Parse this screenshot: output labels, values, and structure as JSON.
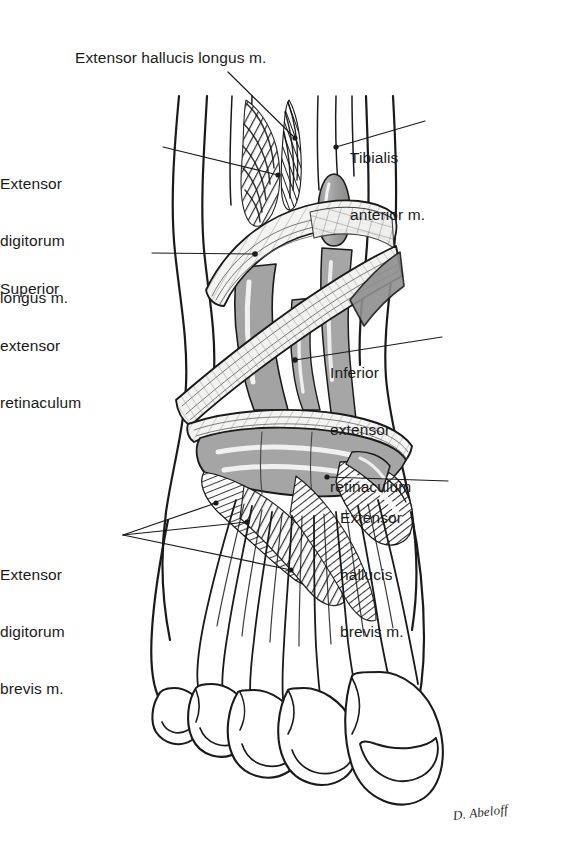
{
  "figure": {
    "background_color": "#ffffff",
    "ink_color": "#1a1a1a",
    "tendon_fill": "#a8a8a8",
    "retinaculum_fill": "#f2f2f0",
    "muscle_hatch_color": "#2b2b2b",
    "signature": "D. Abeloff"
  },
  "labels": [
    {
      "id": "extensor-hallucis-longus",
      "lines": [
        "Extensor hallucis longus m."
      ],
      "align": "left",
      "x": 75,
      "y": 48,
      "leader": "from label baseline down-right to the hallucis longus muscle belly"
    },
    {
      "id": "extensor-digitorum-longus",
      "lines": [
        "Extensor",
        "digitorum",
        "longus m."
      ],
      "align": "right",
      "x": 62,
      "y": 136,
      "leader": "horizontal-ish line right to digitorum longus muscle fibers"
    },
    {
      "id": "superior-extensor-retinaculum",
      "lines": [
        "Superior",
        "extensor",
        "retinaculum"
      ],
      "align": "right",
      "x": 54,
      "y": 241,
      "leader": "horizontal line right to the upper retinaculum band"
    },
    {
      "id": "tibialis-anterior",
      "lines": [
        "Tibialis",
        "anterior m."
      ],
      "align": "left",
      "x": 428,
      "y": 110,
      "leader": "line down-left to tibialis anterior tendon"
    },
    {
      "id": "inferior-extensor-retinaculum",
      "lines": [
        "Inferior",
        "extensor",
        "retinaculum"
      ],
      "align": "left",
      "x": 447,
      "y": 325,
      "leader": "line left to the Y-shaped inferior retinaculum"
    },
    {
      "id": "extensor-hallucis-brevis",
      "lines": [
        "Extensor",
        "hallucis",
        "brevis m."
      ],
      "align": "left",
      "x": 452,
      "y": 470,
      "leader": "line left to hallucis brevis muscle"
    },
    {
      "id": "extensor-digitorum-brevis",
      "lines": [
        "Extensor",
        "digitorum",
        "brevis m."
      ],
      "align": "right",
      "x": 18,
      "y": 527,
      "leader": "three fanned lines right to digitorum brevis muscle bellies"
    }
  ],
  "anatomy_parts": [
    {
      "name": "leg-shaft",
      "kind": "outline"
    },
    {
      "name": "extensor-hallucis-longus-muscle",
      "kind": "muscle-hatching"
    },
    {
      "name": "extensor-digitorum-longus-muscle",
      "kind": "muscle-hatching"
    },
    {
      "name": "tibialis-anterior-tendon",
      "kind": "tendon"
    },
    {
      "name": "superior-extensor-retinaculum-band",
      "kind": "retinaculum"
    },
    {
      "name": "inferior-extensor-retinaculum-band",
      "kind": "retinaculum"
    },
    {
      "name": "extensor-digitorum-brevis-muscle",
      "kind": "muscle-hatching"
    },
    {
      "name": "extensor-hallucis-brevis-muscle",
      "kind": "muscle-hatching"
    },
    {
      "name": "dorsal-tendons",
      "kind": "tendon"
    },
    {
      "name": "toe-1-hallux",
      "kind": "toe"
    },
    {
      "name": "toe-2",
      "kind": "toe"
    },
    {
      "name": "toe-3",
      "kind": "toe"
    },
    {
      "name": "toe-4",
      "kind": "toe"
    },
    {
      "name": "toe-5",
      "kind": "toe"
    }
  ]
}
